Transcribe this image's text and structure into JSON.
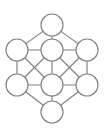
{
  "figure": {
    "background_color": "#ffffff",
    "stroke_color": "#808080",
    "node_fill_color": "#ffffff",
    "stroke_width": 1.15,
    "width": 104,
    "height": 134
  },
  "chart_data": {
    "type": "diagram",
    "subtype": "undirected-graph",
    "title": "",
    "node_count": 8,
    "edge_count": 16,
    "node_radius": 11,
    "nodes": [
      {
        "id": "top",
        "label": "",
        "x": 52,
        "y": 25
      },
      {
        "id": "upper-left",
        "label": "",
        "x": 17,
        "y": 50
      },
      {
        "id": "upper-center",
        "label": "",
        "x": 52,
        "y": 50
      },
      {
        "id": "upper-right",
        "label": "",
        "x": 87,
        "y": 50
      },
      {
        "id": "lower-left",
        "label": "",
        "x": 17,
        "y": 85
      },
      {
        "id": "lower-center",
        "label": "",
        "x": 52,
        "y": 85
      },
      {
        "id": "lower-right",
        "label": "",
        "x": 87,
        "y": 85
      },
      {
        "id": "bottom",
        "label": "",
        "x": 52,
        "y": 112
      }
    ],
    "edges": [
      {
        "from": "top",
        "to": "upper-left"
      },
      {
        "from": "top",
        "to": "upper-center"
      },
      {
        "from": "top",
        "to": "upper-right"
      },
      {
        "from": "upper-left",
        "to": "upper-center"
      },
      {
        "from": "upper-center",
        "to": "upper-right"
      },
      {
        "from": "upper-left",
        "to": "lower-left"
      },
      {
        "from": "upper-center",
        "to": "lower-center"
      },
      {
        "from": "upper-right",
        "to": "lower-right"
      },
      {
        "from": "upper-left",
        "to": "lower-center"
      },
      {
        "from": "upper-center",
        "to": "lower-left"
      },
      {
        "from": "upper-center",
        "to": "lower-right"
      },
      {
        "from": "upper-right",
        "to": "lower-center"
      },
      {
        "from": "lower-left",
        "to": "lower-center"
      },
      {
        "from": "lower-center",
        "to": "lower-right"
      },
      {
        "from": "bottom",
        "to": "lower-left"
      },
      {
        "from": "bottom",
        "to": "lower-center"
      },
      {
        "from": "bottom",
        "to": "lower-right"
      }
    ]
  }
}
